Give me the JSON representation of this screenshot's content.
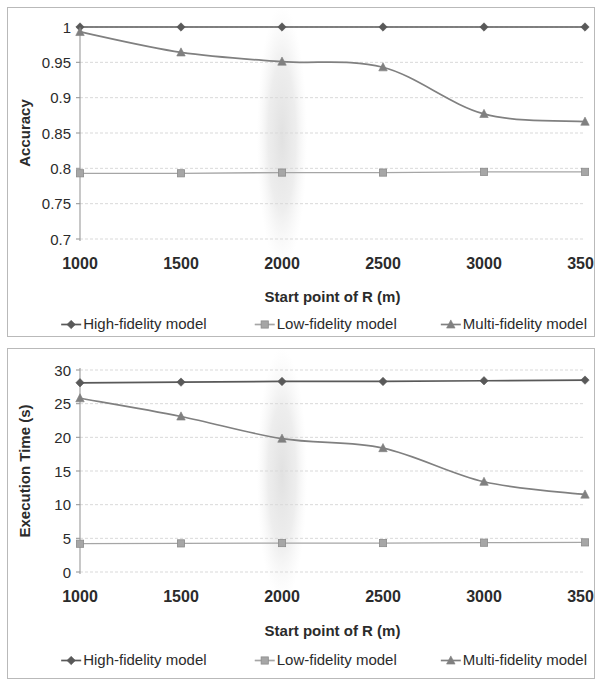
{
  "figure": {
    "background_color": "#ffffff",
    "panel_border_color": "#b9b9b9"
  },
  "series_style": {
    "high_fidelity": {
      "color": "#595959",
      "marker": "diamond",
      "label_key": "legend.high"
    },
    "low_fidelity": {
      "color": "#a6a6a6",
      "marker": "square",
      "label_key": "legend.low"
    },
    "multi_fidelity": {
      "color": "#808080",
      "marker": "triangle",
      "label_key": "legend.multi"
    }
  },
  "legend": {
    "high": "High-fidelity model",
    "low": "Low-fidelity model",
    "multi": "Multi-fidelity model"
  },
  "shared": {
    "xlabel": "Start point of R (m)",
    "xticks": [
      "1000",
      "1500",
      "2000",
      "2500",
      "3000",
      "3500"
    ],
    "highlight_x": 2000
  },
  "chart_data": [
    {
      "id": "accuracy",
      "type": "line",
      "title": "",
      "xlabel": "Start point of R (m)",
      "ylabel": "Accuracy",
      "x": [
        1000,
        1500,
        2000,
        2500,
        3000,
        3500
      ],
      "xticklabels": [
        "1000",
        "1500",
        "2000",
        "2500",
        "3000",
        "3500"
      ],
      "xlim": [
        1000,
        3500
      ],
      "ylim": [
        0.7,
        1.0
      ],
      "yticks": [
        0.7,
        0.75,
        0.8,
        0.85,
        0.9,
        0.95,
        1
      ],
      "yticklabels": [
        "0.7",
        "0.75",
        "0.8",
        "0.85",
        "0.9",
        "0.95",
        "1"
      ],
      "grid": true,
      "legend_position": "bottom",
      "highlight_band": {
        "center_x": 2000,
        "half_width_x": 125,
        "shape": "ellipse"
      },
      "series": [
        {
          "name": "High-fidelity model",
          "values": [
            1.0,
            1.0,
            1.0,
            1.0,
            1.0,
            1.0
          ]
        },
        {
          "name": "Low-fidelity model",
          "values": [
            0.793,
            0.793,
            0.794,
            0.794,
            0.795,
            0.795
          ]
        },
        {
          "name": "Multi-fidelity model",
          "values": [
            0.993,
            0.964,
            0.951,
            0.943,
            0.877,
            0.866
          ]
        }
      ]
    },
    {
      "id": "execution-time",
      "type": "line",
      "title": "",
      "xlabel": "Start point of R (m)",
      "ylabel": "Execution Time  (s)",
      "x": [
        1000,
        1500,
        2000,
        2500,
        3000,
        3500
      ],
      "xticklabels": [
        "1000",
        "1500",
        "2000",
        "2500",
        "3000",
        "3500"
      ],
      "xlim": [
        1000,
        3500
      ],
      "ylim": [
        0,
        30
      ],
      "yticks": [
        0,
        5,
        10,
        15,
        20,
        25,
        30
      ],
      "yticklabels": [
        "0",
        "5",
        "10",
        "15",
        "20",
        "25",
        "30"
      ],
      "grid": true,
      "legend_position": "bottom",
      "highlight_band": {
        "center_x": 2000,
        "half_width_x": 125,
        "shape": "ellipse"
      },
      "series": [
        {
          "name": "High-fidelity model",
          "values": [
            28.1,
            28.2,
            28.3,
            28.3,
            28.4,
            28.5
          ]
        },
        {
          "name": "Low-fidelity model",
          "values": [
            4.2,
            4.25,
            4.3,
            4.3,
            4.35,
            4.4
          ]
        },
        {
          "name": "Multi-fidelity model",
          "values": [
            25.8,
            23.1,
            19.8,
            18.4,
            13.4,
            11.5
          ]
        }
      ]
    }
  ]
}
